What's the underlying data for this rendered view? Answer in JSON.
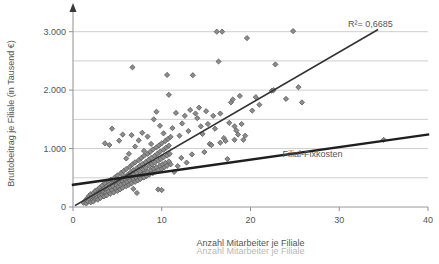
{
  "chart_data": {
    "type": "scatter",
    "title": "",
    "xlabel": "Anzahl Mitarbeiter je Filiale",
    "ylabel": "Bruttobeitrag je Filiale (in Tausend €)",
    "xlim": [
      0,
      40
    ],
    "ylim": [
      0,
      3200
    ],
    "xticks": [
      0,
      10,
      20,
      30,
      40
    ],
    "xtick_labels": [
      "0",
      "10",
      "20",
      "30",
      "40"
    ],
    "yticks": [
      0,
      1000,
      2000,
      3000
    ],
    "ytick_labels": [
      "0",
      "1.000",
      "2.000",
      "3.000"
    ],
    "gridlines_y": [
      500,
      1000,
      1500,
      2000,
      2500,
      3000
    ],
    "grid": "horizontal",
    "legend": "none",
    "marker": {
      "shape": "diamond",
      "fill": "#8c8c8c",
      "edge": "#5a5a5a",
      "size": 4
    },
    "annotations": [
      {
        "name": "r-squared",
        "text": "R²= 0,6685",
        "x": 33.5,
        "y": 3080
      },
      {
        "name": "fixed-cost-line-label",
        "text": "Filial-Fixkosten",
        "x": 27.0,
        "y": 860
      }
    ],
    "x_axis_label_ghost": "Anzahl Mitarbeiter je Filiale",
    "series": [
      {
        "name": "regression-trendline",
        "type": "line",
        "color": "#333333",
        "width": 1.6,
        "points": [
          [
            0.3,
            30
          ],
          [
            34.3,
            3030
          ]
        ]
      },
      {
        "name": "fixed-cost-line",
        "type": "line",
        "color": "#1f1f1f",
        "width": 2.4,
        "points": [
          [
            0.0,
            380
          ],
          [
            40.0,
            1240
          ]
        ]
      },
      {
        "name": "branch-observations",
        "type": "scatter",
        "points": [
          [
            1.2,
            70
          ],
          [
            1.4,
            110
          ],
          [
            1.5,
            60
          ],
          [
            1.6,
            150
          ],
          [
            1.7,
            95
          ],
          [
            1.8,
            190
          ],
          [
            1.9,
            130
          ],
          [
            2.0,
            80
          ],
          [
            2.0,
            220
          ],
          [
            2.1,
            160
          ],
          [
            2.2,
            120
          ],
          [
            2.3,
            240
          ],
          [
            2.3,
            95
          ],
          [
            2.4,
            185
          ],
          [
            2.5,
            140
          ],
          [
            2.5,
            275
          ],
          [
            2.6,
            210
          ],
          [
            2.7,
            160
          ],
          [
            2.8,
            300
          ],
          [
            2.8,
            125
          ],
          [
            2.9,
            250
          ],
          [
            3.0,
            190
          ],
          [
            3.0,
            330
          ],
          [
            3.1,
            155
          ],
          [
            3.2,
            285
          ],
          [
            3.3,
            215
          ],
          [
            3.3,
            370
          ],
          [
            3.4,
            260
          ],
          [
            3.5,
            180
          ],
          [
            3.5,
            320
          ],
          [
            3.6,
            410
          ],
          [
            3.7,
            245
          ],
          [
            3.8,
            355
          ],
          [
            3.8,
            200
          ],
          [
            3.9,
            300
          ],
          [
            4.0,
            440
          ],
          [
            4.0,
            265
          ],
          [
            4.1,
            385
          ],
          [
            4.2,
            225
          ],
          [
            4.2,
            330
          ],
          [
            4.3,
            470
          ],
          [
            4.4,
            290
          ],
          [
            4.5,
            400
          ],
          [
            4.5,
            355
          ],
          [
            4.6,
            250
          ],
          [
            4.7,
            505
          ],
          [
            4.8,
            320
          ],
          [
            4.8,
            430
          ],
          [
            4.9,
            375
          ],
          [
            5.0,
            275
          ],
          [
            5.0,
            540
          ],
          [
            5.1,
            350
          ],
          [
            5.2,
            465
          ],
          [
            5.2,
            410
          ],
          [
            5.3,
            300
          ],
          [
            5.4,
            580
          ],
          [
            5.4,
            380
          ],
          [
            5.5,
            490
          ],
          [
            5.6,
            440
          ],
          [
            5.6,
            330
          ],
          [
            5.7,
            615
          ],
          [
            5.8,
            405
          ],
          [
            5.8,
            525
          ],
          [
            5.9,
            465
          ],
          [
            6.0,
            355
          ],
          [
            6.0,
            650
          ],
          [
            6.1,
            430
          ],
          [
            6.2,
            560
          ],
          [
            6.2,
            495
          ],
          [
            6.3,
            380
          ],
          [
            6.4,
            690
          ],
          [
            6.4,
            455
          ],
          [
            6.5,
            595
          ],
          [
            6.6,
            520
          ],
          [
            6.6,
            405
          ],
          [
            6.7,
            730
          ],
          [
            6.8,
            480
          ],
          [
            6.8,
            630
          ],
          [
            6.9,
            550
          ],
          [
            7.0,
            430
          ],
          [
            7.0,
            765
          ],
          [
            7.1,
            505
          ],
          [
            7.2,
            665
          ],
          [
            7.2,
            580
          ],
          [
            7.3,
            455
          ],
          [
            7.4,
            800
          ],
          [
            7.4,
            530
          ],
          [
            7.5,
            700
          ],
          [
            7.6,
            610
          ],
          [
            7.6,
            480
          ],
          [
            7.7,
            840
          ],
          [
            7.8,
            555
          ],
          [
            7.8,
            735
          ],
          [
            7.9,
            640
          ],
          [
            8.0,
            505
          ],
          [
            8.0,
            875
          ],
          [
            8.1,
            580
          ],
          [
            8.2,
            770
          ],
          [
            8.2,
            670
          ],
          [
            8.3,
            530
          ],
          [
            8.4,
            910
          ],
          [
            8.4,
            605
          ],
          [
            8.5,
            805
          ],
          [
            8.6,
            700
          ],
          [
            8.6,
            555
          ],
          [
            8.7,
            945
          ],
          [
            8.8,
            630
          ],
          [
            8.8,
            840
          ],
          [
            8.9,
            730
          ],
          [
            9.0,
            580
          ],
          [
            9.0,
            985
          ],
          [
            9.1,
            655
          ],
          [
            9.2,
            875
          ],
          [
            9.2,
            760
          ],
          [
            9.3,
            605
          ],
          [
            9.4,
            1020
          ],
          [
            9.4,
            680
          ],
          [
            9.5,
            910
          ],
          [
            9.6,
            790
          ],
          [
            9.6,
            630
          ],
          [
            9.7,
            1055
          ],
          [
            9.8,
            705
          ],
          [
            9.8,
            945
          ],
          [
            9.9,
            820
          ],
          [
            10.0,
            655
          ],
          [
            10.0,
            1090
          ],
          [
            10.1,
            730
          ],
          [
            10.2,
            980
          ],
          [
            10.2,
            850
          ],
          [
            10.3,
            680
          ],
          [
            10.4,
            1130
          ],
          [
            10.4,
            755
          ],
          [
            10.5,
            1015
          ],
          [
            10.6,
            880
          ],
          [
            10.6,
            705
          ],
          [
            10.7,
            1165
          ],
          [
            10.8,
            780
          ],
          [
            10.8,
            1050
          ],
          [
            10.9,
            910
          ],
          [
            11.0,
            730
          ],
          [
            11.0,
            1200
          ],
          [
            3.6,
            1090
          ],
          [
            4.1,
            1060
          ],
          [
            4.4,
            1340
          ],
          [
            5.2,
            1135
          ],
          [
            5.6,
            1240
          ],
          [
            6.0,
            830
          ],
          [
            6.3,
            910
          ],
          [
            6.6,
            1230
          ],
          [
            6.7,
            2390
          ],
          [
            7.0,
            1035
          ],
          [
            7.4,
            1140
          ],
          [
            7.8,
            1270
          ],
          [
            8.0,
            960
          ],
          [
            8.4,
            1205
          ],
          [
            8.8,
            1080
          ],
          [
            9.1,
            1500
          ],
          [
            9.4,
            1630
          ],
          [
            9.8,
            1390
          ],
          [
            10.2,
            1260
          ],
          [
            10.6,
            2260
          ],
          [
            10.8,
            1920
          ],
          [
            11.2,
            1350
          ],
          [
            11.6,
            1610
          ],
          [
            12.0,
            1220
          ],
          [
            12.3,
            1430
          ],
          [
            12.6,
            1560
          ],
          [
            13.0,
            1300
          ],
          [
            13.2,
            1660
          ],
          [
            13.5,
            2255
          ],
          [
            13.8,
            1600
          ],
          [
            14.0,
            1520
          ],
          [
            14.2,
            1700
          ],
          [
            14.4,
            1380
          ],
          [
            14.6,
            1250
          ],
          [
            15.0,
            1640
          ],
          [
            15.2,
            1420
          ],
          [
            15.4,
            1080
          ],
          [
            15.8,
            1560
          ],
          [
            16.0,
            1340
          ],
          [
            16.2,
            3000
          ],
          [
            16.4,
            2490
          ],
          [
            16.6,
            1600
          ],
          [
            16.8,
            3000
          ],
          [
            17.0,
            1180
          ],
          [
            17.2,
            1130
          ],
          [
            17.4,
            820
          ],
          [
            17.6,
            1440
          ],
          [
            17.8,
            1790
          ],
          [
            18.0,
            1840
          ],
          [
            18.2,
            1380
          ],
          [
            18.4,
            1310
          ],
          [
            18.6,
            1240
          ],
          [
            18.8,
            1900
          ],
          [
            19.0,
            1420
          ],
          [
            19.2,
            1150
          ],
          [
            19.4,
            1220
          ],
          [
            19.6,
            2890
          ],
          [
            20.2,
            1650
          ],
          [
            20.6,
            1880
          ],
          [
            21.0,
            1750
          ],
          [
            22.4,
            1990
          ],
          [
            22.6,
            2000
          ],
          [
            22.8,
            2440
          ],
          [
            24.0,
            1850
          ],
          [
            24.8,
            3010
          ],
          [
            25.4,
            2050
          ],
          [
            25.8,
            1790
          ],
          [
            35.0,
            1150
          ],
          [
            6.8,
            310
          ],
          [
            7.2,
            240
          ],
          [
            9.6,
            300
          ],
          [
            10.0,
            290
          ],
          [
            11.4,
            600
          ],
          [
            11.8,
            700
          ],
          [
            12.2,
            840
          ],
          [
            12.8,
            760
          ],
          [
            13.4,
            900
          ],
          [
            14.8,
            940
          ],
          [
            15.6,
            1060
          ],
          [
            16.6,
            1100
          ],
          [
            18.2,
            1150
          ]
        ]
      }
    ]
  }
}
